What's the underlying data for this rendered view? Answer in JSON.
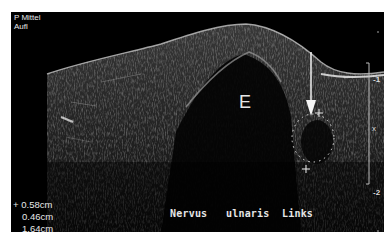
{
  "header": {
    "line1": "P Mittel",
    "line2": "Aufl"
  },
  "image_label": "E",
  "caption": "Nervus   ulnaris  Links",
  "measurements": {
    "marker_symbol": "+",
    "values": [
      "0.58cm",
      "0.46cm",
      "1.64cm"
    ]
  },
  "depth_scale": {
    "tick_upper": "-1",
    "tick_lower": "-2",
    "focus_marker": "x"
  },
  "annotations": {
    "arrow": "arrow-pointing-to-nerve",
    "ellipse": "dotted-ellipse-caliper"
  }
}
